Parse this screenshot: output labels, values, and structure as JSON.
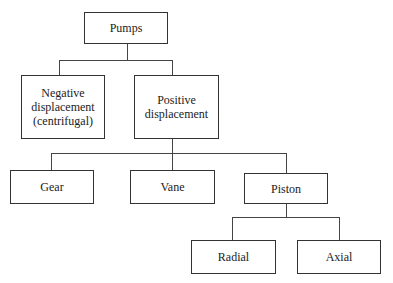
{
  "diagram": {
    "type": "tree",
    "nodes": {
      "root": "Pumps",
      "negative": "Negative\ndisplacement\n(centrifugal)",
      "positive": "Positive\ndisplacement",
      "gear": "Gear",
      "vane": "Vane",
      "piston": "Piston",
      "radial": "Radial",
      "axial": "Axial"
    },
    "edges": [
      [
        "Pumps",
        "Negative displacement (centrifugal)"
      ],
      [
        "Pumps",
        "Positive displacement"
      ],
      [
        "Positive displacement",
        "Gear"
      ],
      [
        "Positive displacement",
        "Vane"
      ],
      [
        "Positive displacement",
        "Piston"
      ],
      [
        "Piston",
        "Radial"
      ],
      [
        "Piston",
        "Axial"
      ]
    ]
  }
}
